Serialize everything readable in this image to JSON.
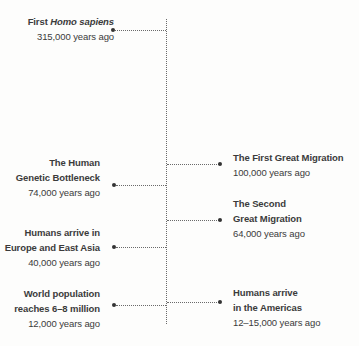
{
  "timeline": {
    "events": [
      {
        "side": "left",
        "title_prefix": "First ",
        "title_italic": "Homo sapiens",
        "lines": [],
        "date": "315,000 years ago"
      },
      {
        "side": "right",
        "lines": [
          "The First Great Migration"
        ],
        "date": "100,000 years ago"
      },
      {
        "side": "left",
        "lines": [
          "The Human",
          "Genetic Bottleneck"
        ],
        "date": "74,000 years ago"
      },
      {
        "side": "right",
        "lines": [
          "The Second",
          "Great Migration"
        ],
        "date": "64,000 years ago"
      },
      {
        "side": "left",
        "lines": [
          "Humans arrive in",
          "Europe and East Asia"
        ],
        "date": "40,000 years ago"
      },
      {
        "side": "left",
        "lines": [
          "World population",
          "reaches 6–8 million"
        ],
        "date": "12,000 years ago"
      },
      {
        "side": "right",
        "lines": [
          "Humans arrive",
          "in the Americas"
        ],
        "date": "12–15,000 years ago"
      }
    ]
  },
  "colors": {
    "text": "#3b3b3b",
    "line": "#6a6a6a",
    "background": "#fdfdfc"
  }
}
